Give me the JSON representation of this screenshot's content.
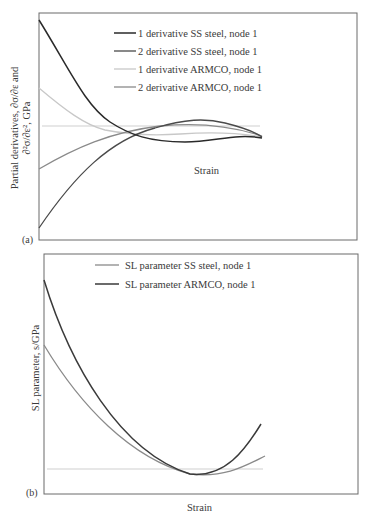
{
  "chart_data": [
    {
      "panel": "(a)",
      "type": "line",
      "title": "",
      "xlabel": "Strain",
      "ylabel": "Partial derivatives, ∂σ/∂ε and ∂²σ/∂ε², GPa",
      "ylabel_line1": "Partial derivatives, ∂σ/∂ε and",
      "ylabel_line2": "∂²σ/∂ε², GPa",
      "ticks": "none",
      "grid": false,
      "legend_position": "upper center",
      "series": [
        {
          "name": "1 derivative SS steel, node 1",
          "color": "#2a2a2a",
          "path": "M39,20 C70,70 85,105 110,122 C130,135 150,142 185,142 C215,142 235,133 262,138"
        },
        {
          "name": "2 derivative SS steel, node 1",
          "color": "#4a4a4a",
          "path": "M39,228 C75,175 110,140 155,128 C185,119 205,118 225,123 C245,128 255,132 262,137"
        },
        {
          "name": "1 derivative ARMCO, node 1",
          "color": "#c8c8c8",
          "path": "M39,88 C65,110 85,125 105,130 C130,135 150,136 180,134 C210,132 240,133 262,137"
        },
        {
          "name": "2 derivative ARMCO, node 1",
          "color": "#8a8a8a",
          "path": "M39,169 C75,148 110,132 160,126 C200,122 235,127 262,136"
        }
      ],
      "reference_line": {
        "color": "#cfcfcf",
        "y": 126,
        "x_start": 42,
        "x_end": 260
      }
    },
    {
      "panel": "(b)",
      "type": "line",
      "title": "",
      "xlabel": "Strain",
      "ylabel": "SL parameter, s/GPa",
      "ticks": "none",
      "grid": false,
      "legend_position": "upper center",
      "series": [
        {
          "name": "SL parameter SS steel, node 1",
          "color": "#8a8a8a",
          "path": "M44,345 C80,405 130,458 190,474 C225,478 245,466 265,456"
        },
        {
          "name": "SL parameter ARMCO, node 1",
          "color": "#3a3a3a",
          "path": "M44,280 C70,365 120,452 190,474 C225,478 245,450 261,424"
        }
      ],
      "reference_line": {
        "color": "#cfcfcf",
        "y": 469,
        "x_start": 47,
        "x_end": 263
      }
    }
  ],
  "panels": {
    "a": {
      "tag": "(a)",
      "xlabel": "Strain",
      "ylabel_line1": "Partial derivatives, ∂σ/∂ε and",
      "ylabel_line2": "∂²σ/∂ε², GPa",
      "legend": [
        "1 derivative SS steel, node 1",
        "2 derivative SS steel, node 1",
        "1 derivative ARMCO, node 1",
        "2 derivative ARMCO, node 1"
      ]
    },
    "b": {
      "tag": "(b)",
      "xlabel": "Strain",
      "ylabel": "SL parameter, s/GPa",
      "legend": [
        "SL parameter SS steel, node 1",
        "SL parameter ARMCO, node 1"
      ]
    }
  }
}
